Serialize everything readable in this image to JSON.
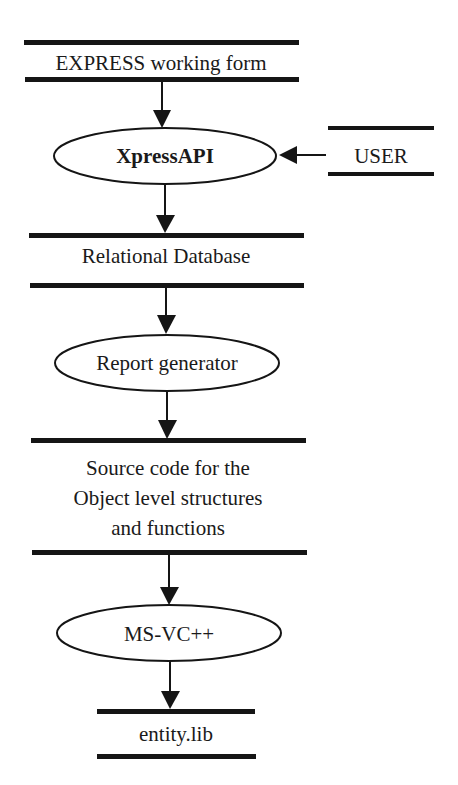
{
  "diagram": {
    "type": "data-flow",
    "stores": [
      {
        "id": "express",
        "lines": [
          "EXPRESS working form"
        ]
      },
      {
        "id": "user",
        "lines": [
          "USER"
        ]
      },
      {
        "id": "reldb",
        "lines": [
          "Relational Database"
        ]
      },
      {
        "id": "source",
        "lines": [
          "Source code for the",
          "Object level structures",
          "and functions"
        ]
      },
      {
        "id": "entitylib",
        "lines": [
          "entity.lib"
        ]
      }
    ],
    "processes": [
      {
        "id": "xpressapi",
        "label": "XpressAPI",
        "bold": true
      },
      {
        "id": "reportgen",
        "label": "Report generator",
        "bold": false
      },
      {
        "id": "msvc",
        "label": "MS-VC++",
        "bold": false
      }
    ],
    "edges": [
      {
        "from": "express",
        "to": "xpressapi"
      },
      {
        "from": "user",
        "to": "xpressapi"
      },
      {
        "from": "xpressapi",
        "to": "reldb"
      },
      {
        "from": "reldb",
        "to": "reportgen"
      },
      {
        "from": "reportgen",
        "to": "source"
      },
      {
        "from": "source",
        "to": "msvc"
      },
      {
        "from": "msvc",
        "to": "entitylib"
      }
    ]
  }
}
